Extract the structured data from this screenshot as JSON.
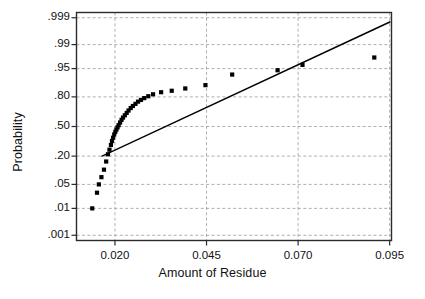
{
  "figure": {
    "type": "normal-probability-plot",
    "x_axis_title": "Amount of Residue",
    "y_axis_title": "Probability"
  },
  "chart_data": {
    "type": "scatter",
    "title": "",
    "subtitle": "",
    "xlabel": "Amount of Residue",
    "ylabel": "Probability",
    "grid": true,
    "legend": null,
    "xlim": [
      0.0095,
      0.0955
    ],
    "ylim": [
      0.0006,
      0.9994
    ],
    "y_scale": "normal-probability",
    "xticks": [
      0.02,
      0.045,
      0.07,
      0.095
    ],
    "xticklabels": [
      "0.020",
      "0.045",
      "0.070",
      "0.095"
    ],
    "yticks": [
      0.999,
      0.99,
      0.95,
      0.8,
      0.5,
      0.2,
      0.05,
      0.01,
      0.001
    ],
    "yticklabels": [
      ".999",
      ".99",
      ".95",
      ".80",
      ".50",
      ".20",
      ".05",
      ".01",
      ".001"
    ],
    "marker": "filled-square",
    "marker_color": "#000000",
    "series": [
      {
        "name": "Residue observations",
        "x": [
          0.0138,
          0.0151,
          0.0156,
          0.0163,
          0.017,
          0.0176,
          0.0181,
          0.0185,
          0.0189,
          0.0192,
          0.0195,
          0.0198,
          0.0201,
          0.0204,
          0.0207,
          0.021,
          0.0214,
          0.0218,
          0.0222,
          0.0227,
          0.0232,
          0.0237,
          0.0243,
          0.0249,
          0.0256,
          0.0263,
          0.0271,
          0.028,
          0.0291,
          0.0304,
          0.0326,
          0.0355,
          0.0392,
          0.0447,
          0.052,
          0.0644,
          0.0712,
          0.0908
        ],
        "y": [
          0.01,
          0.03,
          0.05,
          0.075,
          0.11,
          0.16,
          0.215,
          0.255,
          0.3,
          0.34,
          0.375,
          0.41,
          0.44,
          0.465,
          0.49,
          0.515,
          0.545,
          0.575,
          0.6,
          0.625,
          0.65,
          0.675,
          0.7,
          0.72,
          0.74,
          0.76,
          0.775,
          0.79,
          0.805,
          0.82,
          0.835,
          0.845,
          0.86,
          0.88,
          0.93,
          0.945,
          0.96,
          0.975
        ]
      }
    ],
    "reference_line": {
      "name": "normal reference line",
      "x": [
        0.0165,
        0.095
      ],
      "y": [
        0.2,
        0.9985
      ],
      "color": "#000000"
    },
    "annotations": [],
    "interpretation": "Points curve above the straight reference line in the middle and fall below it at the upper right, indicating a right-skewed, non-normal distribution."
  }
}
